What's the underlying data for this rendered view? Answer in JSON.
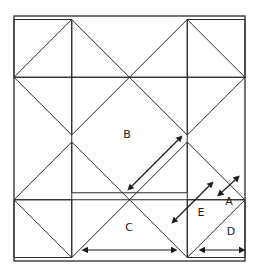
{
  "figure": {
    "background_color": "#ffffff",
    "line_color": "#2b2b2b",
    "frame_color": "#3a3a3a",
    "arrow_color": "#1b1b1b"
  },
  "frame": {
    "name": "outer-square",
    "x": 14,
    "y": 16,
    "width": 231,
    "height": 245
  },
  "grid": {
    "description": "2 by 2 arrangement of diamonds (squares rotated 45 degrees) inscribed in the outer frame",
    "columns": 2,
    "rows": 2,
    "diamond_half_diagonal": 57.75,
    "centers": [
      {
        "cx": 71.75,
        "cy": 77.25
      },
      {
        "cx": 187.25,
        "cy": 77.25
      },
      {
        "cx": 71.75,
        "cy": 199.75
      },
      {
        "cx": 187.25,
        "cy": 199.75
      }
    ]
  },
  "center_square": {
    "name": "central-square",
    "x": 71.75,
    "y": 77.25,
    "width": 115.5,
    "height": 115.5
  },
  "labels": [
    {
      "id": "B",
      "text": "B",
      "x": 127,
      "y": 135
    },
    {
      "id": "C",
      "text": "C",
      "x": 129,
      "y": 228
    },
    {
      "id": "E",
      "text": "E",
      "x": 201,
      "y": 213
    },
    {
      "id": "A",
      "text": "A",
      "x": 229,
      "y": 202
    },
    {
      "id": "D",
      "text": "D",
      "x": 231,
      "y": 232
    }
  ],
  "dimension_arrows": [
    {
      "id": "B",
      "label": "B",
      "orientation": "diagonal",
      "double_headed": true,
      "x1": 132,
      "y1": 186,
      "x2": 178,
      "y2": 140,
      "measures": "diagonal of the large central square half-span"
    },
    {
      "id": "E",
      "label": "E",
      "orientation": "diagonal",
      "double_headed": true,
      "x1": 176,
      "y1": 219,
      "x2": 209,
      "y2": 186,
      "measures": "diagonal side of the small inner square"
    },
    {
      "id": "A",
      "label": "A",
      "orientation": "diagonal",
      "double_headed": true,
      "x1": 222,
      "y1": 192,
      "x2": 235,
      "y2": 180,
      "measures": "short diagonal segment of the small corner triangle"
    },
    {
      "id": "C",
      "label": "C",
      "orientation": "horizontal",
      "double_headed": true,
      "x1": 88,
      "y1": 250,
      "x2": 171,
      "y2": 250,
      "measures": "width of one diamond cell along the bottom edge"
    },
    {
      "id": "D",
      "label": "D",
      "orientation": "horizontal",
      "double_headed": true,
      "x1": 205,
      "y1": 250,
      "x2": 239,
      "y2": 250,
      "measures": "half width of the bottom-right diamond cell"
    }
  ]
}
